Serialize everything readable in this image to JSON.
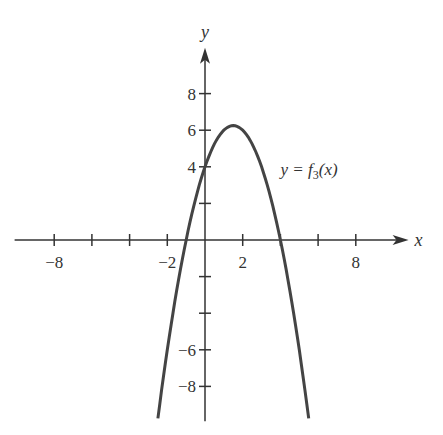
{
  "chart_data": {
    "type": "line",
    "title": "",
    "xlabel": "x",
    "ylabel": "y",
    "xlim": [
      -10.1,
      10.8
    ],
    "ylim": [
      -9.9,
      10.5
    ],
    "x_tick_values": [
      -8,
      -6,
      -4,
      -2,
      2,
      4,
      6,
      8
    ],
    "x_tick_labels": [
      {
        "value": -8,
        "label": "−8"
      },
      {
        "value": -2,
        "label": "−2"
      },
      {
        "value": 2,
        "label": "2"
      },
      {
        "value": 8,
        "label": "8"
      }
    ],
    "y_tick_values": [
      -8,
      -6,
      -4,
      -2,
      2,
      4,
      6,
      8
    ],
    "y_tick_labels": [
      {
        "value": 8,
        "label": "8"
      },
      {
        "value": 6,
        "label": "6"
      },
      {
        "value": 4,
        "label": "4"
      },
      {
        "value": -6,
        "label": "−6"
      },
      {
        "value": -8,
        "label": "−8"
      }
    ],
    "grid": false,
    "series": [
      {
        "name": "y = f3(x)",
        "function": "-x^2 + 3x + 4",
        "x_range": [
          -2.5,
          5.5
        ],
        "points": [
          [
            -2.5,
            -9.75
          ],
          [
            -2,
            -6
          ],
          [
            -1,
            0
          ],
          [
            0,
            4
          ],
          [
            1,
            6
          ],
          [
            1.5,
            6.25
          ],
          [
            2,
            6
          ],
          [
            3,
            4
          ],
          [
            4,
            0
          ],
          [
            5,
            -6
          ],
          [
            5.5,
            -9.75
          ]
        ]
      }
    ],
    "annotations": [
      {
        "text_prefix": "y = f",
        "subscript": "3",
        "text_suffix": "(x)",
        "near": [
          5.6,
          3.8
        ]
      }
    ],
    "colors": {
      "axis": "#333333",
      "curve": "#444444"
    }
  }
}
